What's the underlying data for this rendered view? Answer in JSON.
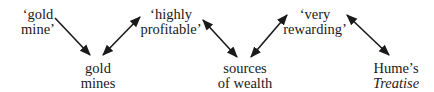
{
  "nodes": [
    {
      "id": "gold-mine-quote",
      "lines": [
        "‘gold",
        "mine’"
      ],
      "italic": [
        false,
        false
      ]
    },
    {
      "id": "gold-mines",
      "lines": [
        "gold",
        "mines"
      ],
      "italic": [
        false,
        false
      ]
    },
    {
      "id": "highly-profitable",
      "lines": [
        "‘highly",
        "profitable’"
      ],
      "italic": [
        false,
        false
      ]
    },
    {
      "id": "sources-of-wealth",
      "lines": [
        "sources",
        "of wealth"
      ],
      "italic": [
        false,
        false
      ]
    },
    {
      "id": "very-rewarding",
      "lines": [
        "‘very",
        "rewarding’"
      ],
      "italic": [
        false,
        false
      ]
    },
    {
      "id": "humes-treatise",
      "lines": [
        "Hume’s",
        "Treatise"
      ],
      "italic": [
        false,
        true
      ]
    }
  ],
  "edges": [
    {
      "from": "gold-mine-quote",
      "to": "gold-mines",
      "direction": "forward"
    },
    {
      "from": "gold-mines",
      "to": "highly-profitable",
      "direction": "both"
    },
    {
      "from": "highly-profitable",
      "to": "sources-of-wealth",
      "direction": "both"
    },
    {
      "from": "sources-of-wealth",
      "to": "very-rewarding",
      "direction": "both"
    },
    {
      "from": "very-rewarding",
      "to": "humes-treatise",
      "direction": "both"
    }
  ],
  "colors": {
    "ink": "#1a1a1a",
    "background": "#ffffff"
  }
}
